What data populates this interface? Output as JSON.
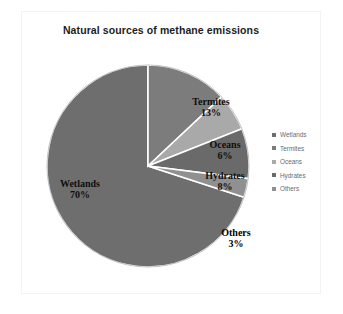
{
  "figure": {
    "title": "Natural sources of methane emissions",
    "background_color": "#ffffff",
    "frame_color": "#f3f3f3"
  },
  "chart_data": {
    "type": "pie",
    "title": "Natural sources of methane emissions",
    "xlabel": "",
    "ylabel": "",
    "grid": false,
    "legend_position": "right",
    "units": "percent",
    "categories": [
      "Wetlands",
      "Termites",
      "Oceans",
      "Hydrates",
      "Others"
    ],
    "values": [
      70,
      13,
      6,
      8,
      3
    ],
    "slices": [
      {
        "name": "Wetlands",
        "value": 70,
        "label": "Wetlands",
        "percent_label": "70%",
        "color": "#6e6e6e",
        "start_angle_deg": 108,
        "end_angle_deg": 360
      },
      {
        "name": "Termites",
        "value": 13,
        "label": "Termites",
        "percent_label": "13%",
        "color": "#7c7c7c",
        "start_angle_deg": 0,
        "end_angle_deg": 46.8
      },
      {
        "name": "Oceans",
        "value": 6,
        "label": "Oceans",
        "percent_label": "6%",
        "color": "#a9a9a9",
        "start_angle_deg": 46.8,
        "end_angle_deg": 68.4
      },
      {
        "name": "Hydrates",
        "value": 8,
        "label": "Hydrates",
        "percent_label": "8%",
        "color": "#6a6a6a",
        "start_angle_deg": 68.4,
        "end_angle_deg": 97.2
      },
      {
        "name": "Others",
        "value": 3,
        "label": "Others",
        "percent_label": "3%",
        "color": "#909090",
        "start_angle_deg": 97.2,
        "end_angle_deg": 108
      }
    ],
    "separator_color": "#ffffff",
    "outline_color": "#555555"
  },
  "legend": {
    "items": [
      {
        "label": "Wetlands",
        "color": "#6e6e6e"
      },
      {
        "label": "Termites",
        "color": "#7c7c7c"
      },
      {
        "label": "Oceans",
        "color": "#a9a9a9"
      },
      {
        "label": "Hydrates",
        "color": "#6a6a6a"
      },
      {
        "label": "Others",
        "color": "#909090"
      }
    ]
  }
}
